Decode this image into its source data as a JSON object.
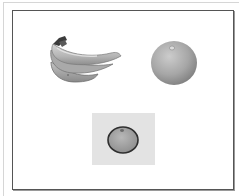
{
  "figure": {
    "items": [
      {
        "name": "bananas",
        "label": "Bunch of bananas",
        "position": "top-left"
      },
      {
        "name": "orange",
        "label": "Orange",
        "position": "top-right"
      },
      {
        "name": "orange-on-tile",
        "label": "Orange on gray tile",
        "position": "bottom-center"
      }
    ],
    "colors": {
      "frame": "#555555",
      "tile": "#e3e3e3",
      "fruit_light": "#cfcfcf",
      "fruit_mid": "#a8a8a8",
      "fruit_dark": "#4a4a4a"
    }
  }
}
